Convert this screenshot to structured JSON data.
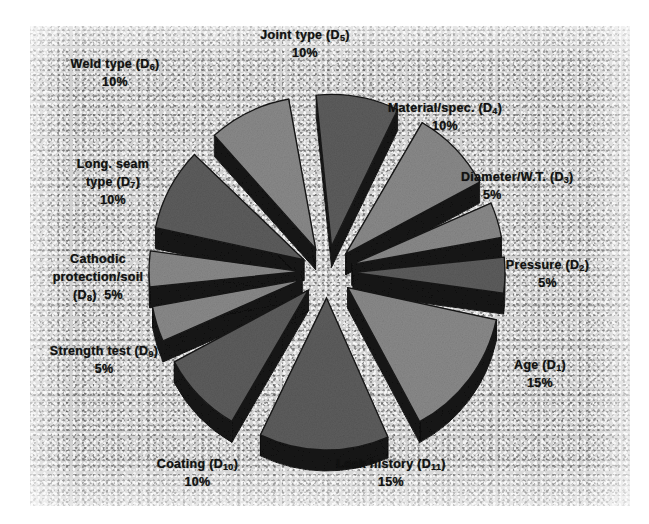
{
  "figure": {
    "kind": "scanned-exploded-3d-pie-chart",
    "background_color": "#d2d2d2",
    "page_color": "#ffffff"
  },
  "chart_data": {
    "type": "pie",
    "title": "",
    "subtitle": "",
    "exploded": true,
    "three_d": true,
    "legend_position": "none",
    "label_format": "name (code) percent",
    "slice_top_color": "#8a8a8a",
    "slice_dark_color": "#5d5d5d",
    "slice_side_color": "#141414",
    "total": 100,
    "categories": [
      "Age (D1)",
      "Pressure (D2)",
      "Diameter/W.T. (D3)",
      "Material/spec. (D4)",
      "Joint type (D5)",
      "Weld type (D6)",
      "Long. seam type (D7)",
      "Cathodic protection/soil (D8)",
      "Strength test (D9)",
      "Coating (D10)",
      "Leak history (D11)"
    ],
    "values": [
      15,
      5,
      5,
      10,
      10,
      10,
      10,
      5,
      5,
      10,
      15
    ],
    "slices": [
      {
        "id": "d1",
        "name": "Age",
        "code": "D",
        "sub": "1",
        "value": 15,
        "percent_text": "15%",
        "label_line1": "Age (D",
        "mid_angle_deg": 52,
        "tone": "light"
      },
      {
        "id": "d2",
        "name": "Pressure",
        "code": "D",
        "sub": "2",
        "value": 5,
        "percent_text": "5%",
        "label_line1": "Pressure (D",
        "mid_angle_deg": 18,
        "tone": "dark"
      },
      {
        "id": "d3",
        "name": "Diameter/W.T.",
        "code": "D",
        "sub": "3",
        "value": 5,
        "percent_text": "5%",
        "label_line1": "Diameter/W.T. (D",
        "mid_angle_deg": -5,
        "tone": "light"
      },
      {
        "id": "d4",
        "name": "Material/spec.",
        "code": "D",
        "sub": "4",
        "value": 10,
        "percent_text": "10%",
        "label_line1": "Material/spec. (D",
        "mid_angle_deg": -33,
        "tone": "light"
      },
      {
        "id": "d5",
        "name": "Joint type",
        "code": "D",
        "sub": "5",
        "value": 10,
        "percent_text": "10%",
        "label_line1": "Joint type (D",
        "mid_angle_deg": -69,
        "tone": "dark"
      },
      {
        "id": "d6",
        "name": "Weld type",
        "code": "D",
        "sub": "6",
        "value": 10,
        "percent_text": "10%",
        "label_line1": "Weld type (D",
        "mid_angle_deg": -105,
        "tone": "light"
      },
      {
        "id": "d7",
        "name": "Long. seam type",
        "code": "D",
        "sub": "7",
        "value": 10,
        "percent_text": "10%",
        "label_line1a": "Long. seam",
        "label_line1b": "type (D",
        "mid_angle_deg": -141,
        "tone": "dark"
      },
      {
        "id": "d8",
        "name": "Cathodic protection/soil",
        "code": "D",
        "sub": "8",
        "value": 5,
        "percent_text": "5%",
        "label_line1a": "Cathodic",
        "label_line1b": "protection/soil",
        "label_line1c": "(D",
        "mid_angle_deg": -167,
        "tone": "light"
      },
      {
        "id": "d9",
        "name": "Strength test",
        "code": "D",
        "sub": "9",
        "value": 5,
        "percent_text": "5%",
        "label_line1": "Strength test (D",
        "mid_angle_deg": 171,
        "tone": "light"
      },
      {
        "id": "d10",
        "name": "Coating",
        "code": "D",
        "sub": "10",
        "value": 10,
        "percent_text": "10%",
        "label_line1": "Coating (D",
        "mid_angle_deg": 135,
        "tone": "dark"
      },
      {
        "id": "d11",
        "name": "Leak history",
        "code": "D",
        "sub": "11",
        "value": 15,
        "percent_text": "15%",
        "label_line1": "Leak history (D",
        "mid_angle_deg": 92,
        "tone": "dark"
      }
    ]
  }
}
